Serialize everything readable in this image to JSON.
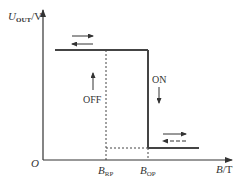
{
  "diagram": {
    "y_axis": {
      "label_main": "U",
      "label_sub": "OUT",
      "label_unit": "/V"
    },
    "x_axis": {
      "label_main": "B",
      "label_unit": "/T"
    },
    "origin": "O",
    "thresholds": [
      {
        "main": "B",
        "sub": "RP",
        "meaning": "release point"
      },
      {
        "main": "B",
        "sub": "OP",
        "meaning": "operate point"
      }
    ],
    "state_labels": {
      "off": "OFF",
      "on": "ON"
    },
    "colors": {
      "line": "#444444",
      "text": "#333333",
      "background": "#ffffff"
    }
  }
}
